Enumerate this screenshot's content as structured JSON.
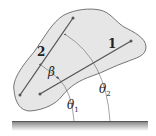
{
  "diagram": {
    "type": "rigid-body-angles",
    "labels": {
      "line1": "1",
      "line2": "2",
      "beta": "β",
      "theta1": "θ",
      "theta1_sub": "1",
      "theta2": "θ",
      "theta2_sub": "2"
    },
    "colors": {
      "body_fill": "#e6e6e6",
      "body_stroke": "#555555",
      "line": "#555555",
      "ground": "#555555",
      "ground_shade": "#9a9a9a",
      "arc": "#666666"
    }
  }
}
